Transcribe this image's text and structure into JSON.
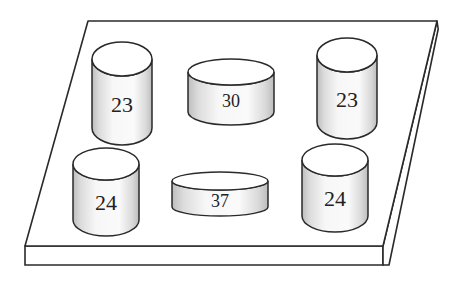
{
  "diagram": {
    "plate": {
      "top_face": [
        [
          88,
          21
        ],
        [
          437,
          21
        ],
        [
          383,
          246
        ],
        [
          25,
          246
        ]
      ],
      "thickness": 19,
      "side_offset": 6
    },
    "colors": {
      "stroke": "#2a2a2a",
      "face": "#ffffff",
      "shade_dark": "#c8c8c8",
      "shade_light": "#f6f6f6"
    },
    "cylinders": [
      {
        "id": "cyl-top-left",
        "label": "23",
        "cx": 122,
        "top": 59,
        "rx": 30,
        "ry": 17,
        "height": 69
      },
      {
        "id": "cyl-top-center",
        "label": "30",
        "cx": 231,
        "top": 72,
        "rx": 43,
        "ry": 13,
        "height": 40
      },
      {
        "id": "cyl-top-right",
        "label": "23",
        "cx": 347,
        "top": 55,
        "rx": 30,
        "ry": 17,
        "height": 67
      },
      {
        "id": "cyl-bottom-left",
        "label": "24",
        "cx": 106,
        "top": 164,
        "rx": 33,
        "ry": 16,
        "height": 56
      },
      {
        "id": "cyl-bottom-center",
        "label": "37",
        "cx": 220,
        "top": 181,
        "rx": 48,
        "ry": 9,
        "height": 26
      },
      {
        "id": "cyl-bottom-right",
        "label": "24",
        "cx": 335,
        "top": 160,
        "rx": 33,
        "ry": 16,
        "height": 56
      }
    ]
  }
}
